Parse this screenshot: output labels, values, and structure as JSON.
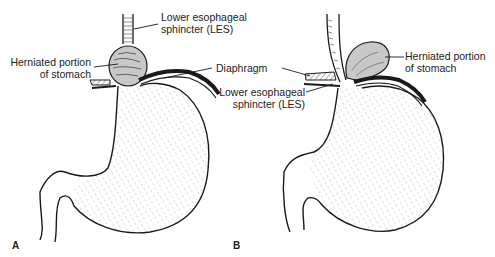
{
  "figure": {
    "panels": [
      {
        "id": "A",
        "letter": "A",
        "labels": {
          "les_line1": "Lower esophageal",
          "les_line2": "sphincter (LES)",
          "herniated_line1": "Herniated portion",
          "herniated_line2": "of stomach"
        }
      },
      {
        "id": "B",
        "letter": "B",
        "labels": {
          "les_line1": "Lower esophageal",
          "les_line2": "sphincter (LES)",
          "herniated_line1": "Herniated portion",
          "herniated_line2": "of stomach"
        }
      }
    ],
    "shared_labels": {
      "diaphragm": "Diaphragm"
    },
    "colors": {
      "ink": "#1a1a1a",
      "herniated_fill": "#c8c8c8",
      "background": "#ffffff"
    }
  }
}
